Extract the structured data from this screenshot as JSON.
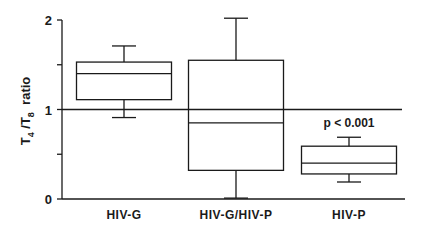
{
  "chart_data": {
    "type": "box",
    "title": "",
    "xlabel": "",
    "ylabel": "T4/T8 ratio",
    "ylabel_parts": {
      "t1": "T",
      "s1": "4",
      "sep": " /",
      "t2": "T",
      "s2": "8",
      "rest": "  ratio"
    },
    "ylim": [
      0,
      2
    ],
    "yticks": [
      0,
      0.5,
      1,
      1.5,
      2
    ],
    "ytick_labels": [
      "0",
      "",
      "1",
      "",
      "2"
    ],
    "grid": false,
    "reference_line": 1.0,
    "categories": [
      "HIV-G",
      "HIV-G/HIV-P",
      "HIV-P"
    ],
    "boxes": [
      {
        "name": "HIV-G",
        "whisker_low": 0.91,
        "q1": 1.11,
        "median": 1.4,
        "q3": 1.53,
        "whisker_high": 1.71
      },
      {
        "name": "HIV-G/HIV-P",
        "whisker_low": 0.01,
        "q1": 0.32,
        "median": 0.85,
        "q3": 1.55,
        "whisker_high": 2.02
      },
      {
        "name": "HIV-P",
        "whisker_low": 0.19,
        "q1": 0.28,
        "median": 0.4,
        "q3": 0.59,
        "whisker_high": 0.69
      }
    ],
    "annotations": [
      {
        "text": "p < 0.001",
        "category": "HIV-P",
        "y": 0.83
      }
    ]
  },
  "colors": {
    "ink": "#1a1a1a",
    "background": "#ffffff"
  }
}
